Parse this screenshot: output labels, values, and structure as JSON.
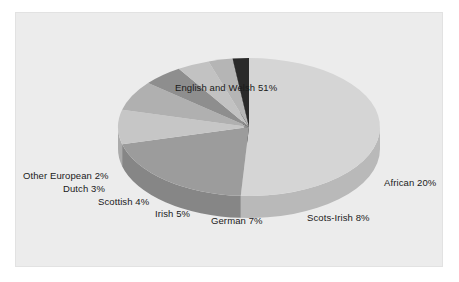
{
  "panel": {
    "background_color": "#ececec",
    "border_color": "#e2e2e2"
  },
  "chart_data": {
    "type": "pie",
    "title": "",
    "subtitle": "",
    "xlabel": "",
    "ylabel": "",
    "legend_position": "none",
    "grid": false,
    "three_d": true,
    "start_angle_deg": 0,
    "direction": "clockwise",
    "units": "percent",
    "total": 100,
    "categories": [
      "English and Welsh",
      "African",
      "Scots-Irish",
      "German",
      "Irish",
      "Scottish",
      "Dutch",
      "Other European"
    ],
    "values": [
      51,
      20,
      8,
      7,
      5,
      4,
      3,
      2
    ],
    "slices": [
      {
        "label": "English and Welsh 51%",
        "name": "English and Welsh",
        "value": 51,
        "color": "#d5d5d5",
        "side_color": "#b9b9b9",
        "label_x": 175,
        "label_y": 82
      },
      {
        "label": "African 20%",
        "name": "African",
        "value": 20,
        "color": "#9c9c9c",
        "side_color": "#868686",
        "label_x": 384,
        "label_y": 177
      },
      {
        "label": "Scots-Irish 8%",
        "name": "Scots-Irish",
        "value": 8,
        "color": "#c6c6c6",
        "side_color": "#ababab",
        "label_x": 307,
        "label_y": 212
      },
      {
        "label": "German 7%",
        "name": "German",
        "value": 7,
        "color": "#b0b0b0",
        "side_color": "#979797",
        "label_x": 211,
        "label_y": 215
      },
      {
        "label": "Irish 5%",
        "name": "Irish",
        "value": 5,
        "color": "#8e8e8e",
        "side_color": "#7c7c7c",
        "label_x": 155,
        "label_y": 208
      },
      {
        "label": "Scottish 4%",
        "name": "Scottish",
        "value": 4,
        "color": "#c2c2c2",
        "side_color": "#a7a7a7",
        "label_x": 98,
        "label_y": 196
      },
      {
        "label": "Dutch 3%",
        "name": "Dutch",
        "value": 3,
        "color": "#b5b5b5",
        "side_color": "#9c9c9c",
        "label_x": 63,
        "label_y": 183
      },
      {
        "label": "Other European 2%",
        "name": "Other European",
        "value": 2,
        "color": "#2a2a2a",
        "side_color": "#1c1c1c",
        "label_x": 23,
        "label_y": 170
      }
    ]
  }
}
